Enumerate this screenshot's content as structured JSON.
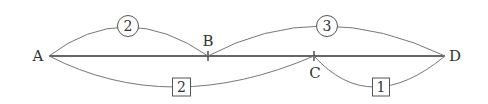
{
  "diagram": {
    "type": "network-graph",
    "nodes": [
      {
        "id": "A",
        "label": "A"
      },
      {
        "id": "B",
        "label": "B"
      },
      {
        "id": "C",
        "label": "C"
      },
      {
        "id": "D",
        "label": "D"
      }
    ],
    "edges": [
      {
        "from": "A",
        "to": "D",
        "style": "straight",
        "weight": null
      },
      {
        "from": "A",
        "to": "B",
        "style": "upper-arc",
        "weight": "2",
        "marker": "circle"
      },
      {
        "from": "B",
        "to": "D",
        "style": "upper-arc",
        "weight": "3",
        "marker": "circle"
      },
      {
        "from": "A",
        "to": "C",
        "style": "lower-arc",
        "weight": "2",
        "marker": "box"
      },
      {
        "from": "C",
        "to": "D",
        "style": "lower-arc",
        "weight": "1",
        "marker": "box"
      }
    ]
  },
  "labels": {
    "A": "A",
    "B": "B",
    "C": "C",
    "D": "D",
    "w_AB": "2",
    "w_BD": "3",
    "w_AC": "2",
    "w_CD": "1"
  },
  "colors": {
    "line": "#333333",
    "arc": "#777777"
  }
}
